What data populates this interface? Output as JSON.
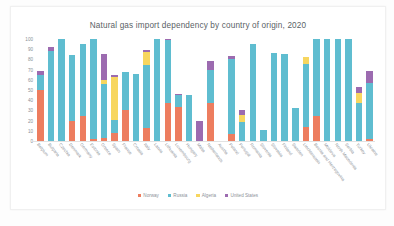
{
  "chart_data": {
    "type": "bar",
    "stacked": true,
    "title": "Natural gas import dependency by country of origin, 2020",
    "xlabel": "",
    "ylabel": "",
    "ylim": [
      0,
      100
    ],
    "yticks": [
      100,
      90,
      80,
      70,
      60,
      50,
      40,
      30,
      20,
      10,
      0
    ],
    "grid": false,
    "legend_position": "bottom",
    "categories": [
      "Belgium",
      "Bulgaria",
      "Czechia",
      "Denmark",
      "Germany",
      "Estonia",
      "Greece",
      "Spain",
      "France",
      "Croatia",
      "Italy",
      "Latvia",
      "Lithuania",
      "Luxembourg",
      "Hungary",
      "Malta",
      "Netherlands",
      "Austria",
      "Poland",
      "Portugal",
      "Romania",
      "Slovenia",
      "Slovakia",
      "Finland",
      "Sweden",
      "Liechtenstein",
      "Bosnia and Herzegovina",
      "Moldova",
      "North Macedonia",
      "Serbia",
      "Turkey",
      "Ukraine"
    ],
    "series": [
      {
        "name": "Norway",
        "color": "#ED7D5F",
        "values": [
          50,
          0,
          0,
          20,
          25,
          2,
          3,
          8,
          30,
          0,
          13,
          0,
          37,
          33,
          0,
          0,
          37,
          0,
          7,
          0,
          0,
          0,
          0,
          0,
          0,
          14,
          25,
          0,
          0,
          0,
          0,
          2
        ]
      },
      {
        "name": "Russia",
        "color": "#5FBDD0",
        "values": [
          15,
          88,
          100,
          64,
          70,
          98,
          53,
          13,
          38,
          66,
          62,
          100,
          62,
          12,
          45,
          0,
          33,
          0,
          73,
          19,
          95,
          11,
          86,
          85,
          32,
          62,
          75,
          100,
          100,
          100,
          37,
          55
        ]
      },
      {
        "name": "Algeria",
        "color": "#F7D65F",
        "values": [
          0,
          0,
          0,
          0,
          0,
          0,
          4,
          42,
          0,
          0,
          12,
          0,
          0,
          0,
          0,
          0,
          0,
          0,
          0,
          7,
          0,
          0,
          0,
          0,
          0,
          6,
          0,
          0,
          0,
          0,
          10,
          0
        ]
      },
      {
        "name": "United States",
        "color": "#9C6BB0",
        "values": [
          4,
          4,
          0,
          0,
          0,
          0,
          25,
          2,
          0,
          0,
          2,
          0,
          1,
          1,
          0,
          20,
          8,
          0,
          3,
          4,
          0,
          0,
          0,
          0,
          0,
          0,
          0,
          0,
          0,
          0,
          6,
          12
        ]
      }
    ]
  }
}
